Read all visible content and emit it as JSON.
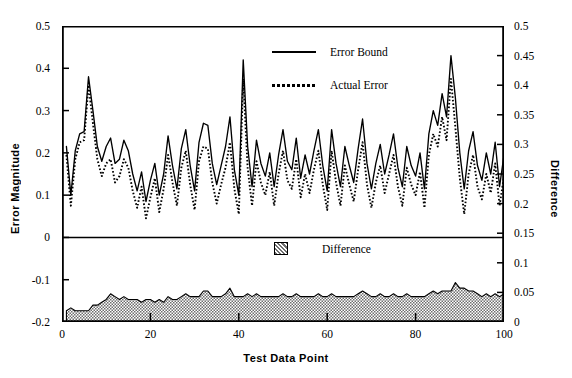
{
  "chart_data": {
    "type": "line",
    "title": "",
    "xlabel": "Test  Data  Point",
    "ylabel": "Error  Magnitude",
    "ylabel_right": "Difference",
    "xlim": [
      0,
      100
    ],
    "ylim": [
      -0.2,
      0.5
    ],
    "ylim_right": [
      0,
      0.5
    ],
    "grid": false,
    "legend_position": "upper-center",
    "xticks": [
      "0",
      "20",
      "40",
      "60",
      "80",
      "100"
    ],
    "xtick_values": [
      0,
      20,
      40,
      60,
      80,
      100
    ],
    "yticks_left": [
      "0.5",
      "0.4",
      "0.3",
      "0.2",
      "0.1",
      "0",
      "-0.1",
      "-0.2"
    ],
    "ytick_values_left": [
      0.5,
      0.4,
      0.3,
      0.2,
      0.1,
      0,
      -0.1,
      -0.2
    ],
    "yticks_right": [
      "0.5",
      "0.45",
      "0.4",
      "0.35",
      "0.3",
      "0.25",
      "0.2",
      "0.15",
      "0.1",
      "0.05",
      "0"
    ],
    "ytick_values_right": [
      0.5,
      0.45,
      0.4,
      0.35,
      0.3,
      0.25,
      0.2,
      0.15,
      0.1,
      0.05,
      0
    ],
    "panel_divider_left_value": 0,
    "panel_divider_right_value": 0.15,
    "legend": [
      {
        "label": "Error Bound",
        "style": "solid",
        "color": "#000000"
      },
      {
        "label": "Actual Error",
        "style": "dotted",
        "color": "#000000"
      },
      {
        "label": "Difference",
        "style": "filled-hatch",
        "color": "#808080"
      }
    ],
    "x": [
      1,
      2,
      3,
      4,
      5,
      6,
      7,
      8,
      9,
      10,
      11,
      12,
      13,
      14,
      15,
      16,
      17,
      18,
      19,
      20,
      21,
      22,
      23,
      24,
      25,
      26,
      27,
      28,
      29,
      30,
      31,
      32,
      33,
      34,
      35,
      36,
      37,
      38,
      39,
      40,
      41,
      42,
      43,
      44,
      45,
      46,
      47,
      48,
      49,
      50,
      51,
      52,
      53,
      54,
      55,
      56,
      57,
      58,
      59,
      60,
      61,
      62,
      63,
      64,
      65,
      66,
      67,
      68,
      69,
      70,
      71,
      72,
      73,
      74,
      75,
      76,
      77,
      78,
      79,
      80,
      81,
      82,
      83,
      84,
      85,
      86,
      87,
      88,
      89,
      90,
      91,
      92,
      93,
      94,
      95,
      96,
      97,
      98,
      99,
      100
    ],
    "series": [
      {
        "name": "Error Bound",
        "style": "solid",
        "values": [
          0.215,
          0.1,
          0.205,
          0.245,
          0.25,
          0.38,
          0.3,
          0.215,
          0.18,
          0.215,
          0.235,
          0.175,
          0.185,
          0.23,
          0.205,
          0.15,
          0.11,
          0.155,
          0.085,
          0.135,
          0.175,
          0.1,
          0.15,
          0.24,
          0.17,
          0.115,
          0.21,
          0.255,
          0.17,
          0.11,
          0.225,
          0.27,
          0.265,
          0.175,
          0.125,
          0.17,
          0.215,
          0.285,
          0.16,
          0.1,
          0.42,
          0.215,
          0.12,
          0.23,
          0.175,
          0.145,
          0.2,
          0.12,
          0.195,
          0.255,
          0.18,
          0.16,
          0.235,
          0.14,
          0.195,
          0.15,
          0.205,
          0.255,
          0.17,
          0.11,
          0.255,
          0.175,
          0.12,
          0.215,
          0.17,
          0.13,
          0.21,
          0.28,
          0.175,
          0.115,
          0.175,
          0.22,
          0.15,
          0.195,
          0.245,
          0.165,
          0.12,
          0.215,
          0.17,
          0.145,
          0.2,
          0.115,
          0.245,
          0.3,
          0.265,
          0.34,
          0.285,
          0.43,
          0.33,
          0.2,
          0.115,
          0.205,
          0.25,
          0.17,
          0.135,
          0.2,
          0.15,
          0.225,
          0.12,
          0.195
        ]
      },
      {
        "name": "Actual Error",
        "style": "dotted",
        "values": [
          0.195,
          0.075,
          0.185,
          0.225,
          0.23,
          0.36,
          0.27,
          0.185,
          0.145,
          0.175,
          0.185,
          0.13,
          0.145,
          0.185,
          0.165,
          0.11,
          0.07,
          0.12,
          0.045,
          0.095,
          0.14,
          0.06,
          0.115,
          0.195,
          0.13,
          0.075,
          0.165,
          0.205,
          0.125,
          0.065,
          0.18,
          0.215,
          0.21,
          0.13,
          0.08,
          0.125,
          0.165,
          0.225,
          0.115,
          0.055,
          0.375,
          0.165,
          0.075,
          0.18,
          0.13,
          0.1,
          0.155,
          0.075,
          0.15,
          0.205,
          0.135,
          0.115,
          0.185,
          0.095,
          0.15,
          0.105,
          0.16,
          0.205,
          0.125,
          0.065,
          0.205,
          0.13,
          0.075,
          0.17,
          0.125,
          0.085,
          0.16,
          0.225,
          0.125,
          0.07,
          0.13,
          0.17,
          0.105,
          0.15,
          0.195,
          0.12,
          0.075,
          0.165,
          0.125,
          0.1,
          0.155,
          0.07,
          0.195,
          0.245,
          0.215,
          0.285,
          0.23,
          0.375,
          0.26,
          0.14,
          0.055,
          0.15,
          0.195,
          0.12,
          0.09,
          0.15,
          0.105,
          0.175,
          0.075,
          0.145
        ]
      },
      {
        "name": "Difference",
        "style": "filled-hatch",
        "values": [
          0.02,
          0.025,
          0.02,
          0.02,
          0.02,
          0.02,
          0.03,
          0.03,
          0.035,
          0.04,
          0.05,
          0.045,
          0.04,
          0.045,
          0.04,
          0.04,
          0.04,
          0.035,
          0.04,
          0.04,
          0.035,
          0.04,
          0.035,
          0.045,
          0.04,
          0.04,
          0.045,
          0.05,
          0.045,
          0.045,
          0.045,
          0.055,
          0.055,
          0.045,
          0.045,
          0.045,
          0.05,
          0.06,
          0.045,
          0.045,
          0.045,
          0.05,
          0.045,
          0.05,
          0.045,
          0.045,
          0.045,
          0.045,
          0.045,
          0.05,
          0.045,
          0.045,
          0.05,
          0.045,
          0.045,
          0.045,
          0.045,
          0.05,
          0.045,
          0.045,
          0.05,
          0.045,
          0.045,
          0.045,
          0.045,
          0.045,
          0.05,
          0.055,
          0.05,
          0.045,
          0.045,
          0.05,
          0.045,
          0.045,
          0.05,
          0.045,
          0.045,
          0.05,
          0.045,
          0.045,
          0.045,
          0.045,
          0.05,
          0.055,
          0.05,
          0.055,
          0.055,
          0.055,
          0.07,
          0.06,
          0.06,
          0.055,
          0.055,
          0.05,
          0.045,
          0.05,
          0.045,
          0.05,
          0.045,
          0.05
        ]
      }
    ]
  }
}
